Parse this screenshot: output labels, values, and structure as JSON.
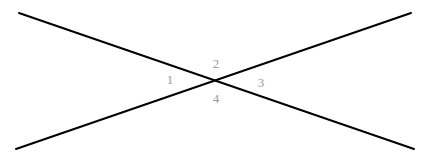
{
  "figure": {
    "type": "geometry-diagram",
    "width": 425,
    "height": 164,
    "background_color": "#ffffff",
    "line_color": "#000000",
    "line_width": 2,
    "label_color": "#9a9a9a",
    "intersection": {
      "x": 217,
      "y": 77
    },
    "lines": [
      {
        "name": "line-descending",
        "x1": 19,
        "y1": 13,
        "x2": 414,
        "y2": 149
      },
      {
        "name": "line-ascending",
        "x1": 16,
        "y1": 149,
        "x2": 411,
        "y2": 13
      }
    ],
    "labels": [
      {
        "text": "1",
        "x": 170,
        "y": 79,
        "position": "left"
      },
      {
        "text": "2",
        "x": 216,
        "y": 63,
        "position": "top"
      },
      {
        "text": "3",
        "x": 261,
        "y": 82,
        "position": "right"
      },
      {
        "text": "4",
        "x": 216,
        "y": 98,
        "position": "bottom"
      }
    ]
  }
}
